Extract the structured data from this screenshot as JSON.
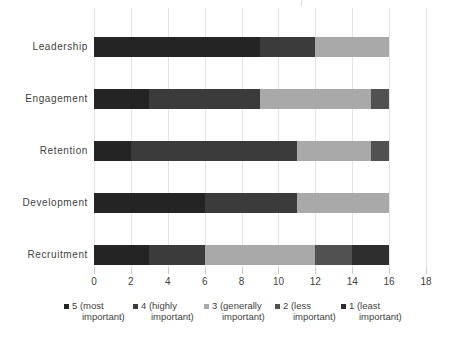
{
  "chart_data": {
    "type": "bar",
    "orientation": "horizontal",
    "stacked": true,
    "title": "",
    "xlabel": "",
    "ylabel": "",
    "categories": [
      "Leadership",
      "Engagement",
      "Retention",
      "Development",
      "Recruitment"
    ],
    "series": [
      {
        "name": "5 (most important)",
        "color": "#242424",
        "values": [
          9,
          3,
          2,
          6,
          3
        ]
      },
      {
        "name": "4 (highly important)",
        "color": "#3b3b3b",
        "values": [
          3,
          6,
          9,
          5,
          3
        ]
      },
      {
        "name": "3 (generally important)",
        "color": "#a9a9a9",
        "values": [
          4,
          6,
          4,
          5,
          6
        ]
      },
      {
        "name": "2 (less important)",
        "color": "#515151",
        "values": [
          0,
          1,
          1,
          0,
          2
        ]
      },
      {
        "name": "1 (least important)",
        "color": "#2e2e2e",
        "values": [
          0,
          0,
          0,
          0,
          2
        ]
      }
    ],
    "xlim": [
      0,
      18
    ],
    "xticks": [
      0,
      2,
      4,
      6,
      8,
      10,
      12,
      14,
      16,
      18
    ],
    "grid": true,
    "legend_position": "bottom"
  },
  "legend": {
    "entries": [
      {
        "line1": "5 (most",
        "line2": "important)"
      },
      {
        "line1": "4 (highly",
        "line2": "important)"
      },
      {
        "line1": "3 (generally",
        "line2": "important)"
      },
      {
        "line1": "2 (less",
        "line2": "important)"
      },
      {
        "line1": "1 (least",
        "line2": "important)"
      }
    ]
  },
  "colors": {
    "gridline": "#e4e4e4",
    "tick": "#c9c9c9",
    "text": "#3f3f3f",
    "background": "#ffffff"
  }
}
